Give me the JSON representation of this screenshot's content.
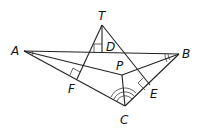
{
  "diagram": {
    "type": "geometry",
    "points": {
      "A": {
        "label": "A",
        "x": 24,
        "y": 51,
        "lx": 11,
        "ly": 55
      },
      "T": {
        "label": "T",
        "x": 102,
        "y": 25,
        "lx": 98,
        "ly": 20
      },
      "B": {
        "label": "B",
        "x": 179,
        "y": 54,
        "lx": 182,
        "ly": 58
      },
      "C": {
        "label": "C",
        "x": 125,
        "y": 106,
        "lx": 120,
        "ly": 124
      },
      "P": {
        "label": "P",
        "x": 122,
        "y": 75,
        "lx": 116,
        "ly": 70
      },
      "D": {
        "label": "D",
        "x": 102,
        "y": 52,
        "lx": 106,
        "ly": 51
      },
      "F": {
        "label": "F",
        "x": 77,
        "y": 79,
        "lx": 68,
        "ly": 93
      },
      "E": {
        "label": "E",
        "x": 150,
        "y": 85,
        "lx": 150,
        "ly": 98
      }
    },
    "segments": [
      "AB",
      "AC",
      "AP",
      "BC",
      "BP",
      "PC",
      "TF",
      "TE",
      "TD"
    ],
    "right_angles": [
      "D",
      "F",
      "E"
    ],
    "angle_marks": {
      "A": 1,
      "B": 2,
      "C": 3
    }
  }
}
